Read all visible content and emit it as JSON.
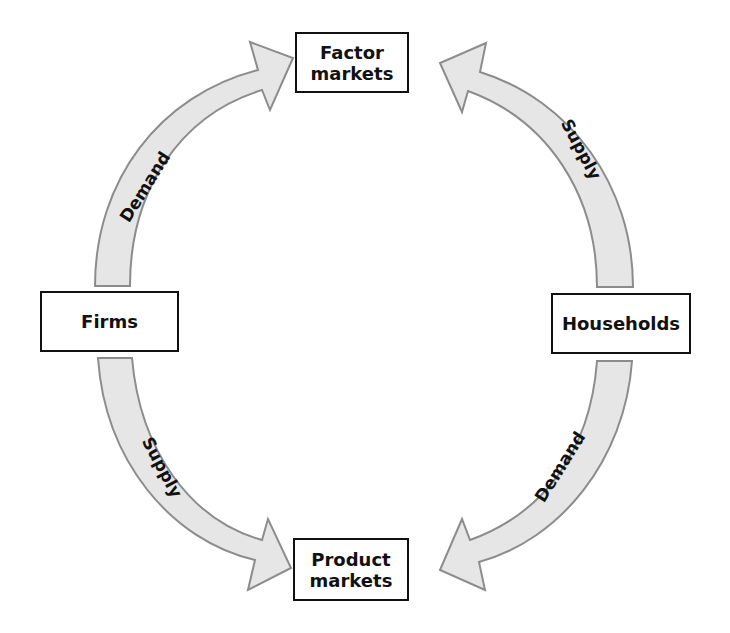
{
  "diagram": {
    "type": "circular-flow",
    "nodes": {
      "factor_markets": "Factor\nmarkets",
      "firms": "Firms",
      "households": "Households",
      "product_markets": "Product\nmarkets"
    },
    "flows": [
      {
        "from": "Firms",
        "to": "Factor markets",
        "label": "Demand"
      },
      {
        "from": "Households",
        "to": "Factor markets",
        "label": "Supply"
      },
      {
        "from": "Firms",
        "to": "Product markets",
        "label": "Supply"
      },
      {
        "from": "Households",
        "to": "Product markets",
        "label": "Demand"
      }
    ],
    "colors": {
      "arrow_fill": "#e6e6e6",
      "arrow_stroke": "#8c8c8c",
      "box_border": "#111111",
      "text": "#111111"
    }
  }
}
